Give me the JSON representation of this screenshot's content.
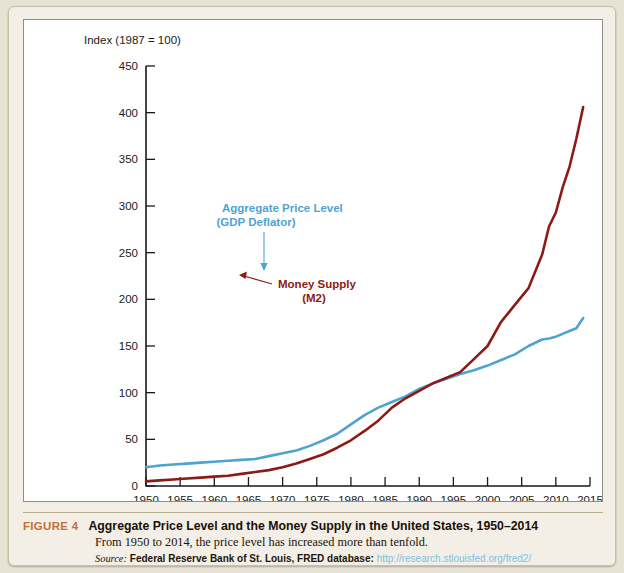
{
  "figure": {
    "number_label": "FIGURE 4",
    "title": "Aggregate Price Level and the Money Supply in the United States, 1950–2014",
    "subtitle": "From 1950 to 2014, the price level has increased more than tenfold.",
    "source_label": "Source:",
    "source_name": "Federal Reserve Bank of St. Louis, FRED database:",
    "source_url": "http://research.stlouisfed.org/fred2/",
    "accent_color": "#c2703a",
    "url_color": "#7fbfe0"
  },
  "chart_data": {
    "type": "line",
    "title": "Aggregate Price Level and the Money Supply in the United States, 1950–2014",
    "xlabel": "",
    "ylabel": "Index (1987 = 100)",
    "ylim": [
      0,
      450
    ],
    "xlim": [
      1950,
      2015
    ],
    "ytick_values": [
      0,
      50,
      100,
      150,
      200,
      250,
      300,
      350,
      400,
      450
    ],
    "ytick_labels": [
      "0",
      "50",
      "100",
      "150",
      "200",
      "250",
      "300",
      "350",
      "400",
      "450"
    ],
    "xtick_values": [
      1950,
      1955,
      1960,
      1965,
      1970,
      1975,
      1980,
      1985,
      1990,
      1995,
      2000,
      2005,
      2010,
      2015
    ],
    "xtick_labels": [
      "1950",
      "1955",
      "1960",
      "1965",
      "1970",
      "1975",
      "1980",
      "1985",
      "1990",
      "1995",
      "2000",
      "2005",
      "2010",
      "2015"
    ],
    "grid": false,
    "legend": "inline-annotations",
    "x": [
      1950,
      1952,
      1954,
      1956,
      1958,
      1960,
      1962,
      1964,
      1966,
      1968,
      1970,
      1972,
      1974,
      1976,
      1978,
      1980,
      1982,
      1984,
      1986,
      1988,
      1990,
      1992,
      1994,
      1996,
      1998,
      2000,
      2002,
      2004,
      2006,
      2008,
      2009,
      2010,
      2011,
      2012,
      2013,
      2014
    ],
    "series": [
      {
        "name": "Aggregate Price Level (GDP Deflator)",
        "color": "#4fa3d1",
        "label_line1": "Aggregate Price Level",
        "label_line2": "(GDP Deflator)",
        "values": [
          20,
          22,
          23,
          24,
          25,
          26,
          27,
          28,
          29,
          32,
          35,
          38,
          43,
          49,
          56,
          66,
          76,
          84,
          90,
          96,
          104,
          110,
          115,
          120,
          124,
          129,
          135,
          141,
          150,
          157,
          158,
          160,
          163,
          166,
          169,
          180
        ]
      },
      {
        "name": "Money Supply (M2)",
        "color": "#8b1b14",
        "label_line1": "Money Supply",
        "label_line2": "(M2)",
        "values": [
          5,
          6,
          7,
          8,
          9,
          10,
          11,
          13,
          15,
          17,
          20,
          24,
          29,
          34,
          41,
          49,
          59,
          70,
          84,
          94,
          102,
          110,
          116,
          122,
          136,
          150,
          176,
          194,
          212,
          248,
          278,
          293,
          320,
          342,
          372,
          406
        ]
      }
    ],
    "annotations": [
      {
        "text": "Aggregate Price Level (GDP Deflator)",
        "color": "#4fa3d1",
        "points_to_year": 1965,
        "points_to_value": 30
      },
      {
        "text": "Money Supply (M2)",
        "color": "#8b1b14",
        "points_to_year": 1981,
        "points_to_value": 58
      }
    ]
  }
}
